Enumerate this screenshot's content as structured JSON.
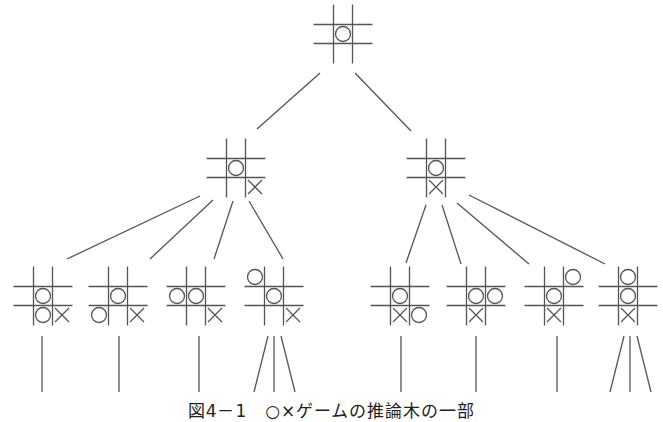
{
  "figure": {
    "caption": "図4－1　○×ゲームの推論木の一部",
    "colors": {
      "line": "#555555",
      "mark": "#555555",
      "background": "#ffffff"
    }
  },
  "legend": {
    "O": "○ mark",
    "X": "× mark"
  },
  "nodes": [
    {
      "id": "root",
      "level": 0,
      "cx": 343,
      "cy": 34,
      "board": [
        "",
        "",
        "",
        "",
        "O",
        "",
        "",
        "",
        ""
      ]
    },
    {
      "id": "L1a",
      "level": 1,
      "cx": 236,
      "cy": 168,
      "board": [
        "",
        "",
        "",
        "",
        "O",
        "",
        "",
        "",
        "X"
      ]
    },
    {
      "id": "L1b",
      "level": 1,
      "cx": 436,
      "cy": 168,
      "board": [
        "",
        "",
        "",
        "",
        "O",
        "",
        "",
        "X",
        ""
      ]
    },
    {
      "id": "L2a",
      "level": 2,
      "cx": 43,
      "cy": 296,
      "board": [
        "",
        "",
        "",
        "",
        "O",
        "",
        "",
        "O",
        "X"
      ]
    },
    {
      "id": "L2b",
      "level": 2,
      "cx": 118,
      "cy": 296,
      "board": [
        "",
        "",
        "",
        "",
        "O",
        "",
        "O",
        "",
        "X"
      ]
    },
    {
      "id": "L2c",
      "level": 2,
      "cx": 196,
      "cy": 296,
      "board": [
        "",
        "",
        "",
        "O",
        "O",
        "",
        "",
        "",
        "X"
      ]
    },
    {
      "id": "L2d",
      "level": 2,
      "cx": 274,
      "cy": 296,
      "board": [
        "O",
        "",
        "",
        "",
        "O",
        "",
        "",
        "",
        "X"
      ]
    },
    {
      "id": "L2e",
      "level": 2,
      "cx": 400,
      "cy": 296,
      "board": [
        "",
        "",
        "",
        "",
        "O",
        "",
        "",
        "X",
        "O"
      ]
    },
    {
      "id": "L2f",
      "level": 2,
      "cx": 476,
      "cy": 296,
      "board": [
        "",
        "",
        "",
        "",
        "O",
        "O",
        "",
        "X",
        ""
      ]
    },
    {
      "id": "L2g",
      "level": 2,
      "cx": 554,
      "cy": 296,
      "board": [
        "",
        "",
        "O",
        "",
        "O",
        "",
        "",
        "X",
        ""
      ]
    },
    {
      "id": "L2h",
      "level": 2,
      "cx": 628,
      "cy": 296,
      "board": [
        "",
        "O",
        "",
        "",
        "O",
        "",
        "",
        "X",
        ""
      ]
    }
  ],
  "edges": [
    {
      "from": "root",
      "to": "L1a",
      "x1": 320,
      "y1": 73,
      "x2": 257,
      "y2": 129
    },
    {
      "from": "root",
      "to": "L1b",
      "x1": 355,
      "y1": 73,
      "x2": 411,
      "y2": 131
    },
    {
      "from": "L1a",
      "to": "L2a",
      "x1": 200,
      "y1": 196,
      "x2": 67,
      "y2": 259
    },
    {
      "from": "L1a",
      "to": "L2b",
      "x1": 213,
      "y1": 200,
      "x2": 150,
      "y2": 259
    },
    {
      "from": "L1a",
      "to": "L2c",
      "x1": 233,
      "y1": 201,
      "x2": 214,
      "y2": 259
    },
    {
      "from": "L1a",
      "to": "L2d",
      "x1": 249,
      "y1": 201,
      "x2": 283,
      "y2": 259
    },
    {
      "from": "L1b",
      "to": "L2e",
      "x1": 426,
      "y1": 205,
      "x2": 406,
      "y2": 263
    },
    {
      "from": "L1b",
      "to": "L2f",
      "x1": 442,
      "y1": 205,
      "x2": 461,
      "y2": 264
    },
    {
      "from": "L1b",
      "to": "L2g",
      "x1": 457,
      "y1": 203,
      "x2": 529,
      "y2": 264
    },
    {
      "from": "L1b",
      "to": "L2h",
      "x1": 469,
      "y1": 195,
      "x2": 605,
      "y2": 264
    }
  ],
  "continuations": [
    {
      "x1": 42,
      "y1": 336,
      "x2": 42,
      "y2": 392
    },
    {
      "x1": 119,
      "y1": 336,
      "x2": 119,
      "y2": 392
    },
    {
      "x1": 199,
      "y1": 336,
      "x2": 199,
      "y2": 392
    },
    {
      "x1": 268,
      "y1": 336,
      "x2": 254,
      "y2": 392
    },
    {
      "x1": 274,
      "y1": 336,
      "x2": 274,
      "y2": 392
    },
    {
      "x1": 281,
      "y1": 336,
      "x2": 295,
      "y2": 392
    },
    {
      "x1": 401,
      "y1": 336,
      "x2": 401,
      "y2": 392
    },
    {
      "x1": 476,
      "y1": 336,
      "x2": 476,
      "y2": 392
    },
    {
      "x1": 557,
      "y1": 336,
      "x2": 557,
      "y2": 392
    },
    {
      "x1": 624,
      "y1": 336,
      "x2": 610,
      "y2": 392
    },
    {
      "x1": 630,
      "y1": 336,
      "x2": 630,
      "y2": 392
    },
    {
      "x1": 637,
      "y1": 336,
      "x2": 651,
      "y2": 392
    }
  ]
}
